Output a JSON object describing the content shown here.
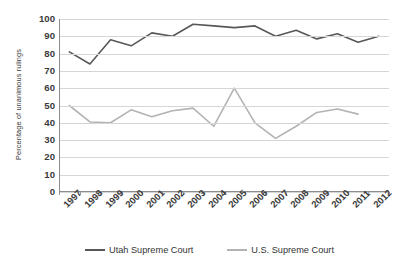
{
  "chart_data": {
    "type": "line",
    "title": "",
    "subtitle": "",
    "xlabel": "",
    "ylabel": "Percentage of unanimous rulings",
    "categories": [
      "1997",
      "1998",
      "1999",
      "2000",
      "2001",
      "2002",
      "2003",
      "2004",
      "2005",
      "2006",
      "2007",
      "2008",
      "2009",
      "2010",
      "2011",
      "2012"
    ],
    "ylim": [
      0,
      100
    ],
    "ytick_values": [
      0,
      10,
      20,
      30,
      40,
      50,
      60,
      70,
      80,
      90,
      100
    ],
    "ytick_labels": [
      "0",
      "10",
      "20",
      "30",
      "40",
      "50",
      "60",
      "70",
      "80",
      "90",
      "100"
    ],
    "grid": true,
    "legend_position": "bottom",
    "series": [
      {
        "name": "Utah Supreme Court",
        "color": "#585858",
        "values": [
          81,
          74,
          88,
          84.5,
          92,
          90,
          97,
          96,
          95,
          96,
          90,
          93.5,
          88.5,
          91.5,
          86.5,
          90
        ]
      },
      {
        "name": "U.S. Supreme Court",
        "color": "#b3b3b3",
        "values": [
          50,
          40.5,
          40,
          47.5,
          43.5,
          47,
          48.5,
          38,
          60,
          40,
          31,
          38,
          46,
          48,
          45,
          null
        ]
      }
    ]
  },
  "colors": {
    "axis": "#8d8d8d",
    "grid": "#d6d6d6",
    "text": "#3b3b3b",
    "background": "#ffffff"
  }
}
